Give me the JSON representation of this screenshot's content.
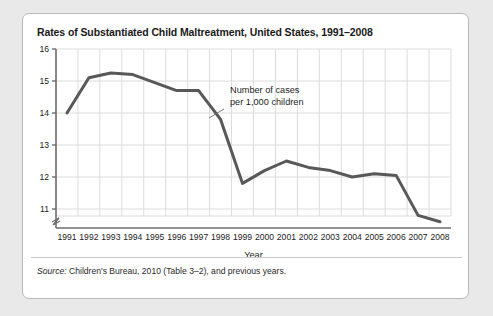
{
  "figure": {
    "title": "Rates of Substantiated Child Maltreatment, United States, 1991–2008",
    "source_lead": "Source:",
    "source_rest": " Children's Bureau, 2010 (Table 3–2), and previous years."
  },
  "chart_data": {
    "type": "line",
    "title": "Rates of Substantiated Child Maltreatment, United States, 1991–2008",
    "xlabel": "Year",
    "ylabel": "",
    "annotation": {
      "line1": "Number of cases",
      "line2": "per 1,000 children"
    },
    "x": [
      "1991",
      "1992",
      "1993",
      "1994",
      "1995",
      "1996",
      "1997",
      "1998",
      "1999",
      "2000",
      "2001",
      "2002",
      "2003",
      "2004",
      "2005",
      "2006",
      "2007",
      "2008"
    ],
    "categories": [
      "1991",
      "1992",
      "1993",
      "1994",
      "1995",
      "1996",
      "1997",
      "1998",
      "1999",
      "2000",
      "2001",
      "2002",
      "2003",
      "2004",
      "2005",
      "2006",
      "2007",
      "2008"
    ],
    "values": [
      14.0,
      15.1,
      15.25,
      15.2,
      14.95,
      14.7,
      14.7,
      13.8,
      11.8,
      12.2,
      12.5,
      12.3,
      12.2,
      12.0,
      12.1,
      12.05,
      10.8,
      10.6
    ],
    "series": [
      {
        "name": "Number of cases per 1,000 children",
        "values": [
          14.0,
          15.1,
          15.25,
          15.2,
          14.95,
          14.7,
          14.7,
          13.8,
          11.8,
          12.2,
          12.5,
          12.3,
          12.2,
          12.0,
          12.1,
          12.05,
          10.8,
          10.6
        ]
      }
    ],
    "yticks": [
      "11",
      "12",
      "13",
      "14",
      "15",
      "16"
    ],
    "ytick_values": [
      11,
      12,
      13,
      14,
      15,
      16
    ],
    "ylim": [
      10.35,
      16
    ],
    "axis_break": true,
    "grid": true,
    "legend": "none",
    "line_color": "#585858",
    "grid_color": "#dcdcdc",
    "axis_color": "#6e6e6e"
  }
}
